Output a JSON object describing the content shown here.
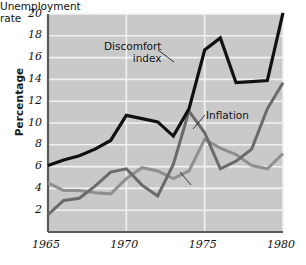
{
  "chart_data": {
    "type": "line",
    "title": "",
    "xlabel": "",
    "ylabel": "Percentage",
    "xlim": [
      1965,
      1980
    ],
    "ylim": [
      0,
      20
    ],
    "grid": true,
    "legend_position": "inline-annotations",
    "x": [
      1965,
      1966,
      1967,
      1968,
      1969,
      1970,
      1971,
      1972,
      1973,
      1974,
      1975,
      1976,
      1977,
      1978,
      1979,
      1980
    ],
    "xticks": [
      "1965",
      "1970",
      "1975",
      "1980"
    ],
    "xtick_values": [
      1965,
      1970,
      1975,
      1980
    ],
    "yticks": [
      "2",
      "4",
      "6",
      "8",
      "10",
      "12",
      "14",
      "16",
      "18",
      "20"
    ],
    "ytick_values": [
      2,
      4,
      6,
      8,
      10,
      12,
      14,
      16,
      18,
      20
    ],
    "series": [
      {
        "name": "Discomfort index",
        "color": "#111111",
        "width": 3.2,
        "values": [
          6.1,
          6.6,
          7.0,
          7.6,
          8.4,
          10.7,
          10.4,
          10.1,
          8.8,
          11.3,
          16.7,
          17.8,
          13.7,
          13.8,
          13.9,
          20.1
        ]
      },
      {
        "name": "Inflation",
        "color": "#6a6a6a",
        "width": 3.0,
        "values": [
          1.6,
          2.9,
          3.1,
          4.2,
          5.5,
          5.8,
          4.3,
          3.3,
          6.2,
          11.1,
          9.1,
          5.8,
          6.5,
          7.6,
          11.3,
          13.7
        ]
      },
      {
        "name": "Unemployment rate",
        "color": "#8f8f8f",
        "width": 3.0,
        "values": [
          4.5,
          3.8,
          3.8,
          3.6,
          3.5,
          4.9,
          5.9,
          5.6,
          4.9,
          5.6,
          8.5,
          7.7,
          7.1,
          6.1,
          5.8,
          7.2
        ]
      }
    ],
    "annotations": [
      {
        "id": "discomfort",
        "text": "Discomfort\nindex",
        "target_x": 1973.0,
        "target_y": 14.0
      },
      {
        "id": "inflation",
        "text": "Inflation",
        "target_x": 1974.3,
        "target_y": 9.6
      },
      {
        "id": "unemployment",
        "text": "Unemployment\nrate",
        "target_x": 1975.3,
        "target_y": 8.2
      }
    ],
    "style": {
      "plot_background": "#c9c9c9",
      "gridline_color": "#f2f2f2",
      "axis_color": "#5a5a5a",
      "page_background": "#ffffff"
    }
  }
}
